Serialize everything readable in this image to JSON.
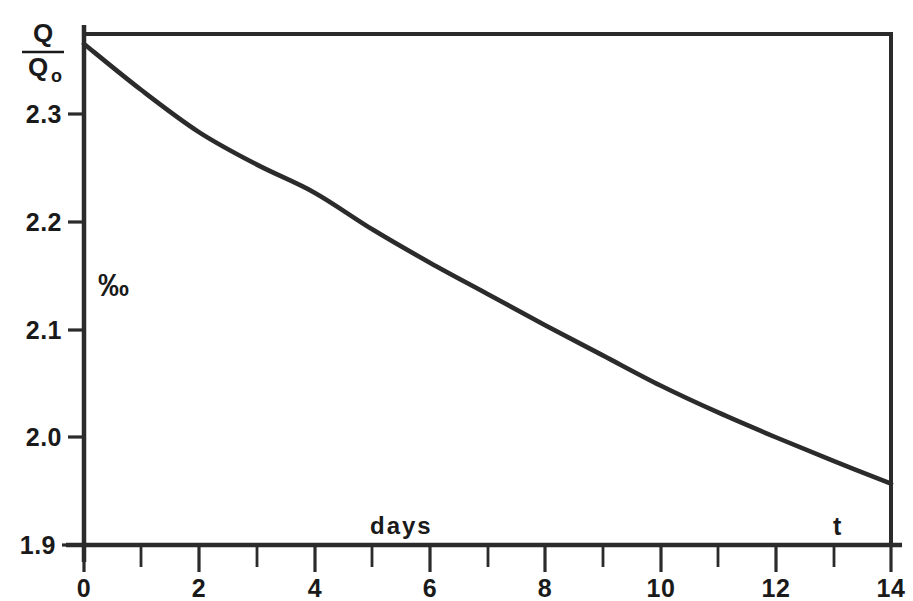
{
  "chart_data": {
    "type": "line",
    "title": "",
    "subtitle": "",
    "xlabel": "t",
    "xlabel_secondary": "days",
    "ylabel": "Q/Q0",
    "ylabel_numerator": "Q",
    "ylabel_denominator": "Q",
    "ylabel_denominator_sub": "o",
    "unit_annotation": "‰",
    "unit_annotation_text": "%oo",
    "xlim": [
      0,
      14
    ],
    "ylim": [
      1.9,
      2.4
    ],
    "xtick_labels": [
      "0",
      "2",
      "4",
      "6",
      "8",
      "10",
      "12",
      "14"
    ],
    "xticks": [
      0,
      2,
      4,
      6,
      8,
      10,
      12,
      14
    ],
    "xticks_minor": [
      1,
      3,
      5,
      7,
      9,
      11,
      13
    ],
    "ytick_labels": [
      "2.3",
      "2.2",
      "2.1",
      "2.0",
      "1.9"
    ],
    "yticks": [
      2.3,
      2.2,
      2.1,
      2.0,
      1.9
    ],
    "grid": false,
    "legend": "none",
    "line_color": "#2b2b2b",
    "axis_color": "#2b2b2b",
    "background_color": "#ffffff",
    "x": [
      0,
      1,
      2,
      3,
      4,
      5,
      6,
      7,
      8,
      9,
      10,
      11,
      12,
      13,
      14
    ],
    "values": [
      2.365,
      2.322,
      2.283,
      2.253,
      2.227,
      2.193,
      2.162,
      2.133,
      2.104,
      2.076,
      2.048,
      2.023,
      2.0,
      1.978,
      1.957
    ],
    "series": [
      {
        "name": "Q/Q0",
        "x": [
          0,
          1,
          2,
          3,
          4,
          5,
          6,
          7,
          8,
          9,
          10,
          11,
          12,
          13,
          14
        ],
        "values": [
          2.365,
          2.322,
          2.283,
          2.253,
          2.227,
          2.193,
          2.162,
          2.133,
          2.104,
          2.076,
          2.048,
          2.023,
          2.0,
          1.978,
          1.957
        ]
      }
    ]
  },
  "labels": {
    "y_axis_numerator": "Q",
    "y_axis_denominator": "Q",
    "y_axis_denominator_sub": "o",
    "per_mille": "‰",
    "days": "days",
    "t": "t",
    "y0": "2.3",
    "y1": "2.2",
    "y2": "2.1",
    "y3": "2.0",
    "y4": "1.9",
    "x0": "0",
    "x1": "2",
    "x2": "4",
    "x3": "6",
    "x4": "8",
    "x5": "10",
    "x6": "12",
    "x7": "14"
  }
}
